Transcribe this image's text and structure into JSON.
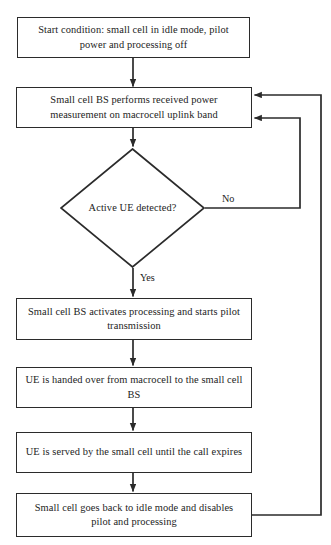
{
  "diagram": {
    "type": "flowchart",
    "orientation": "top-to-bottom",
    "colors": {
      "background": "#ffffff",
      "stroke": "#2b2b2b",
      "text": "#232323"
    },
    "nodes": [
      {
        "id": "start",
        "shape": "rectangle",
        "text": "Start condition: small cell in idle mode, pilot power and processing off"
      },
      {
        "id": "measure",
        "shape": "rectangle",
        "text": "Small cell BS performs received power measurement on macrocell uplink band"
      },
      {
        "id": "decision",
        "shape": "diamond",
        "text": "Active UE detected?"
      },
      {
        "id": "activate",
        "shape": "rectangle",
        "text": "Small cell BS activates processing and starts pilot transmission"
      },
      {
        "id": "handover",
        "shape": "rectangle",
        "text": "UE is handed over from macrocell to the small cell BS"
      },
      {
        "id": "serve",
        "shape": "rectangle",
        "text": "UE is served by the small cell until the call expires"
      },
      {
        "id": "idle",
        "shape": "rectangle",
        "text": "Small cell goes back to idle mode and disables pilot and processing"
      }
    ],
    "edge_labels": {
      "no": "No",
      "yes": "Yes"
    },
    "edges": [
      {
        "from": "start",
        "to": "measure",
        "label": ""
      },
      {
        "from": "measure",
        "to": "decision",
        "label": ""
      },
      {
        "from": "decision",
        "to": "measure",
        "label": "No"
      },
      {
        "from": "decision",
        "to": "activate",
        "label": "Yes"
      },
      {
        "from": "activate",
        "to": "handover",
        "label": ""
      },
      {
        "from": "handover",
        "to": "serve",
        "label": ""
      },
      {
        "from": "serve",
        "to": "idle",
        "label": ""
      },
      {
        "from": "idle",
        "to": "measure",
        "label": ""
      }
    ]
  }
}
